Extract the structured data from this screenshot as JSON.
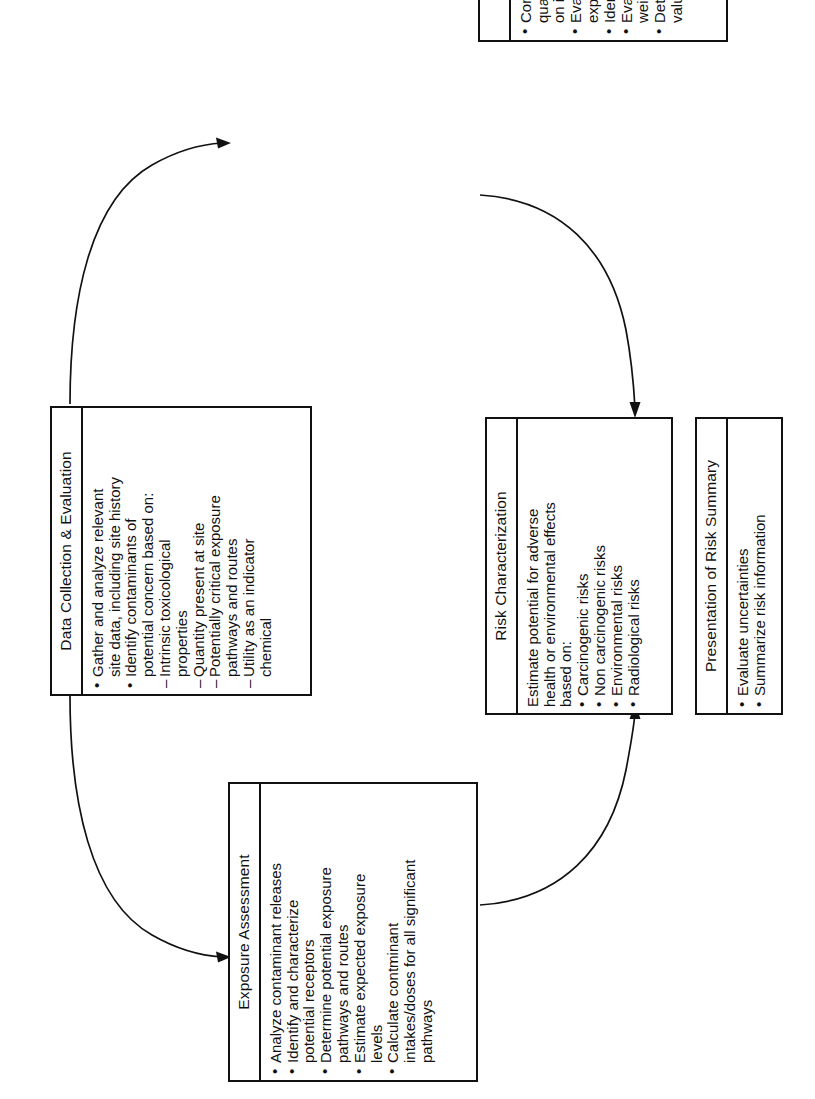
{
  "diagram": {
    "orientation": "rotated-90-ccw",
    "background_color": "#ffffff",
    "line_color": "#111111"
  },
  "nodes": {
    "data_collection": {
      "title": "Data Collection & Evaluation",
      "items": [
        {
          "marker": "bullet",
          "text": "Gather and analyze relevant\nsite data, including site history"
        },
        {
          "marker": "bullet",
          "text": "Identify contaminants of\npotential concern based on:"
        },
        {
          "marker": "dash",
          "text": "Intrinsic toxicological\nproperties"
        },
        {
          "marker": "dash",
          "text": "Quantity present at site"
        },
        {
          "marker": "dash",
          "text": "Potentially critical exposure\npathways and routes"
        },
        {
          "marker": "dash",
          "text": "Utility as an indicator\nchemical"
        }
      ]
    },
    "toxicity_assessment": {
      "title": "Toxicity Assessment",
      "items": [
        {
          "marker": "bullet",
          "text": "Compile qualitative and\nquantitative toxicological profiles\non indicator chemicals"
        },
        {
          "marker": "bullet",
          "text": "Evalute adverse effects of\nexposure"
        },
        {
          "marker": "bullet",
          "text": "Identify sources of uncertainty"
        },
        {
          "marker": "bullet",
          "text": "Evalute toxicological\nweight-of-evidence"
        },
        {
          "marker": "bullet",
          "text": "Determine all relevant toxicity\nvalues for indicator chemicals"
        }
      ]
    },
    "exposure_assessment": {
      "title": "Exposure Assessment",
      "items": [
        {
          "marker": "bullet",
          "text": "Analyze contaminant releases"
        },
        {
          "marker": "bullet",
          "text": "Identify and characterize\npotential receptors"
        },
        {
          "marker": "bullet",
          "text": "Determine potential exposure\npathways and routes"
        },
        {
          "marker": "bullet",
          "text": "Estimate expected exposure\nlevels"
        },
        {
          "marker": "bullet",
          "text": "Calculate contminant\nintakes/doses for all significant\npathways"
        }
      ]
    },
    "risk_characterization": {
      "title": "Risk Characterization",
      "items": [
        {
          "marker": "plain",
          "text": "Estimate potential for adverse\nhealth or environmental effects\nbased on:"
        },
        {
          "marker": "bullet",
          "text": "Carcinogenic risks"
        },
        {
          "marker": "bullet",
          "text": "Non carcinogenic risks"
        },
        {
          "marker": "bullet",
          "text": "Environmental risks"
        },
        {
          "marker": "bullet",
          "text": "Radiological risks"
        }
      ]
    },
    "presentation_of_risk_summary": {
      "title": "Presentation of Risk Summary",
      "items": [
        {
          "marker": "bullet",
          "text": "Evaluate uncertainties"
        },
        {
          "marker": "bullet",
          "text": "Summarize risk information"
        }
      ]
    }
  },
  "connectors": [
    {
      "from": "data_collection",
      "to": "toxicity_assessment",
      "style": "curved-arrow"
    },
    {
      "from": "data_collection",
      "to": "exposure_assessment",
      "style": "curved-arrow"
    },
    {
      "from": "toxicity_assessment",
      "to": "risk_characterization",
      "style": "curved-arrow"
    },
    {
      "from": "exposure_assessment",
      "to": "risk_characterization",
      "style": "curved-arrow"
    }
  ]
}
